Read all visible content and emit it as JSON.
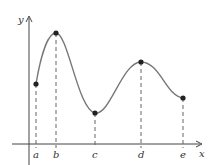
{
  "diagram": {
    "title": "",
    "axes": {
      "x_label": "x",
      "y_label": "y",
      "color": "#444444"
    },
    "curve": {
      "color": "#777777",
      "description": "smooth curve with local max at b and d, local min at c"
    },
    "points": [
      {
        "label": "a",
        "x": 36,
        "y": 84
      },
      {
        "label": "b",
        "x": 56,
        "y": 33
      },
      {
        "label": "c",
        "x": 95,
        "y": 113
      },
      {
        "label": "d",
        "x": 141,
        "y": 62
      },
      {
        "label": "e",
        "x": 183,
        "y": 98
      }
    ],
    "point_color": "#222222",
    "dashed_line_color": "#666666"
  }
}
